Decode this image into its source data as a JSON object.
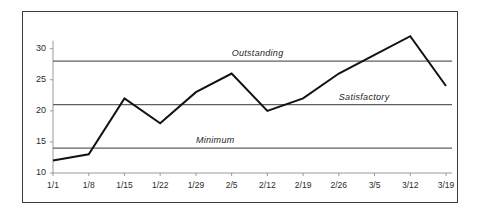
{
  "figure": {
    "border_color": "#3a3a3a",
    "background_color": "#ffffff"
  },
  "chart_data": {
    "type": "line",
    "title": "",
    "xlabel": "",
    "ylabel": "",
    "categories": [
      "1/1",
      "1/8",
      "1/15",
      "1/22",
      "1/29",
      "2/5",
      "2/12",
      "2/19",
      "2/26",
      "3/5",
      "3/12",
      "3/19"
    ],
    "values": [
      12,
      13,
      22,
      18,
      23,
      26,
      20,
      22,
      26,
      29,
      32,
      24
    ],
    "series": [
      {
        "name": "",
        "color": "#121212",
        "values": [
          12,
          13,
          22,
          18,
          23,
          26,
          20,
          22,
          26,
          29,
          32,
          24
        ]
      }
    ],
    "ylim": [
      10,
      33
    ],
    "yticks": [
      10,
      15,
      20,
      25,
      30
    ],
    "ytick_labels": [
      "10",
      "15",
      "20",
      "25",
      "30"
    ],
    "grid": false,
    "legend": "none",
    "reference_lines": [
      {
        "label": "Outstanding",
        "value": 28,
        "color": "#5f5f5f",
        "label_x_category": "2/5"
      },
      {
        "label": "Satisfactory",
        "value": 21,
        "color": "#5f5f5f",
        "label_x_category": "2/26"
      },
      {
        "label": "Minimum",
        "value": 14,
        "color": "#5f5f5f",
        "label_x_category": "1/29"
      }
    ]
  }
}
